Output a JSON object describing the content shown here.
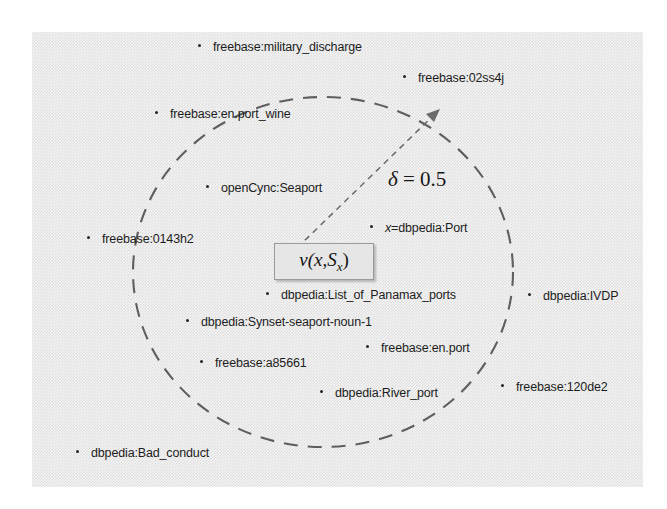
{
  "figure": {
    "panel_background": "#f3f3f3",
    "ink_color": "#1d1d1d"
  },
  "boundary": {
    "name": "delta-ball-boundary",
    "style": "dashed-ellipse",
    "color": "#5e5e5e"
  },
  "radius_annotation": {
    "symbol": "δ",
    "equals": " = ",
    "value": "0.5",
    "full": "δ = 0.5"
  },
  "center": {
    "label_prefix": "v(",
    "label_var": "x",
    "label_comma": ",",
    "label_set": "S",
    "label_sub": "x",
    "label_suffix": ")",
    "full": "v(x, Sx)"
  },
  "nodes_inside": [
    {
      "id": "node-military-discharge",
      "label": "freebase:military_discharge"
    },
    {
      "id": "node-en-port-wine",
      "label": "freebase:en.port_wine"
    },
    {
      "id": "node-opencyc-seaport",
      "label": "openCync:Seaport"
    },
    {
      "id": "node-dbpedia-port",
      "label": "x=dbpedia:Port",
      "italic_prefix": "x",
      "rest": "=dbpedia:Port"
    },
    {
      "id": "node-list-of-panamax-ports",
      "label": "dbpedia:List_of_Panamax_ports"
    },
    {
      "id": "node-synset-seaport-noun-1",
      "label": "dbpedia:Synset-seaport-noun-1"
    },
    {
      "id": "node-freebase-en-port",
      "label": "freebase:en.port"
    },
    {
      "id": "node-freebase-a85661",
      "label": "freebase:a85661"
    },
    {
      "id": "node-dbpedia-river-port",
      "label": "dbpedia:River_port"
    }
  ],
  "nodes_outside": [
    {
      "id": "node-freebase-02ss4j",
      "label": "freebase:02ss4j"
    },
    {
      "id": "node-freebase-0143h2",
      "label": "freebase:0143h2"
    },
    {
      "id": "node-dbpedia-ivdp",
      "label": "dbpedia:IVDP"
    },
    {
      "id": "node-freebase-120de2",
      "label": "freebase:120de2"
    },
    {
      "id": "node-dbpedia-bad-conduct",
      "label": "dbpedia:Bad_conduct"
    }
  ]
}
